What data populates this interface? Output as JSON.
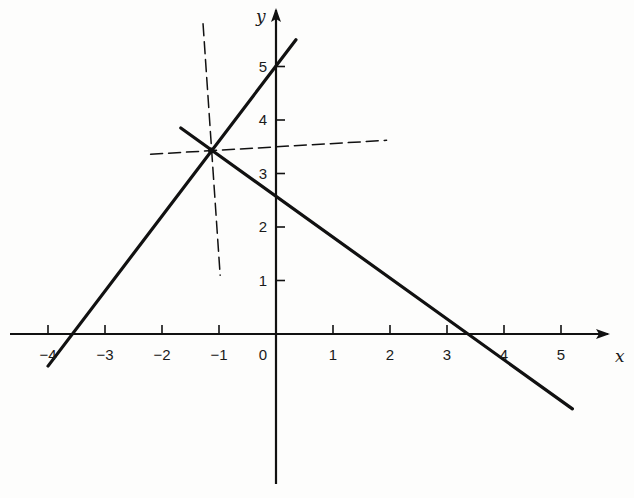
{
  "figure": {
    "colors": {
      "ink": "#111111",
      "background": "#fdfdfc"
    }
  },
  "axes": {
    "x_label": "x",
    "y_label": "y",
    "x_ticks": [
      {
        "value": -4,
        "label": "−4"
      },
      {
        "value": -3,
        "label": "−3"
      },
      {
        "value": -2,
        "label": "−2"
      },
      {
        "value": -1,
        "label": "−1"
      },
      {
        "value": 1,
        "label": "1"
      },
      {
        "value": 2,
        "label": "2"
      },
      {
        "value": 3,
        "label": "3"
      },
      {
        "value": 4,
        "label": "4"
      },
      {
        "value": 5,
        "label": "5"
      }
    ],
    "origin_label": "0",
    "y_ticks": [
      {
        "value": 1,
        "label": "1"
      },
      {
        "value": 2,
        "label": "2"
      },
      {
        "value": 3,
        "label": "3"
      },
      {
        "value": 4,
        "label": "4"
      },
      {
        "value": 5,
        "label": "5"
      }
    ],
    "xlim": [
      -4.3,
      6.0
    ],
    "ylim": [
      -2.9,
      5.9
    ]
  },
  "lines": [
    {
      "name": "steep-ascending-line",
      "style": "solid",
      "from": [
        -4.0,
        -0.6
      ],
      "to": [
        0.35,
        5.5
      ],
      "y_intercept": 5.0,
      "x_intercept": -3.7
    },
    {
      "name": "descending-line",
      "style": "solid",
      "from": [
        -1.67,
        3.85
      ],
      "to": [
        5.2,
        -1.4
      ],
      "y_intercept": 2.6,
      "x_intercept": 3.4
    },
    {
      "name": "dashed-vertical-guide",
      "style": "dashed",
      "from": [
        -1.28,
        5.8
      ],
      "to": [
        -0.98,
        1.1
      ]
    },
    {
      "name": "dashed-horizontal-guide",
      "style": "dashed",
      "from": [
        -2.2,
        3.36
      ],
      "to": [
        1.94,
        3.62
      ]
    }
  ],
  "intersection": {
    "x": -1.14,
    "y": 3.43
  }
}
